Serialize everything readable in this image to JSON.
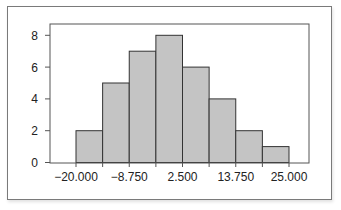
{
  "chart_data": {
    "type": "bar",
    "subtype": "histogram",
    "title": "",
    "xlabel": "",
    "ylabel": "",
    "bin_edges": [
      -20.0,
      -14.375,
      -8.75,
      -3.125,
      2.5,
      8.125,
      13.75,
      19.375,
      25.0
    ],
    "categories": [
      "-20.000 to -14.375",
      "-14.375 to -8.750",
      "-8.750 to -3.125",
      "-3.125 to 2.500",
      "2.500 to 8.125",
      "8.125 to 13.750",
      "13.750 to 19.375",
      "19.375 to 25.000"
    ],
    "values": [
      2,
      5,
      7,
      8,
      6,
      4,
      2,
      1
    ],
    "xticks": [
      -20.0,
      -8.75,
      2.5,
      13.75,
      25.0
    ],
    "xtick_labels": [
      "−20.000",
      "−8.750",
      "2.500",
      "13.750",
      "25.000"
    ],
    "yticks": [
      0,
      2,
      4,
      6,
      8
    ],
    "ytick_labels": [
      "0",
      "2",
      "4",
      "6",
      "8"
    ],
    "ylim": [
      0,
      8.7
    ],
    "xlim": [
      -24.9,
      32.4
    ],
    "grid": false,
    "legend": null,
    "colors": {
      "bar_fill": "#c4c4c4",
      "bar_edge": "#333333",
      "axis": "#555555",
      "frame": "#7a7a7a"
    }
  }
}
